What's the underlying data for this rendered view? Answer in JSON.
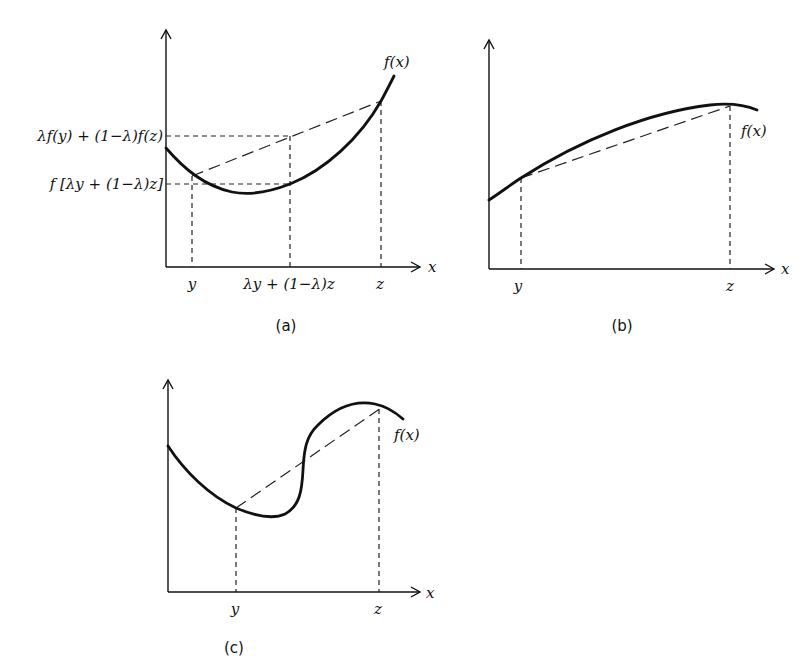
{
  "panels": {
    "a": {
      "caption": "(a)",
      "function_label": "f(x)",
      "x_axis_label": "x",
      "x_ticks": {
        "y": "y",
        "mid": "λy + (1−λ)z",
        "z": "z"
      },
      "y_ticks": {
        "upper": "λf(y) + (1−λ)f(z)",
        "lower": "f [λy + (1−λ)z]"
      },
      "description": "convex function: chord lies above the curve"
    },
    "b": {
      "caption": "(b)",
      "function_label": "f(x)",
      "x_axis_label": "x",
      "x_ticks": {
        "y": "y",
        "z": "z"
      },
      "description": "concave function: chord lies below the curve"
    },
    "c": {
      "caption": "(c)",
      "function_label": "f(x)",
      "x_axis_label": "x",
      "x_ticks": {
        "y": "y",
        "z": "z"
      },
      "description": "neither convex nor concave: chord crosses the curve"
    }
  },
  "colors": {
    "ink": "#111111",
    "background": "#ffffff"
  }
}
